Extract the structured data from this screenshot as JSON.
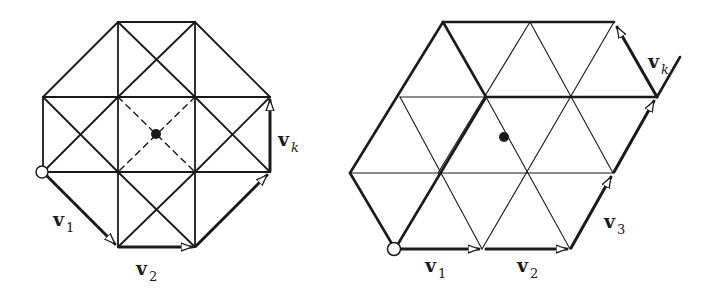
{
  "figures": [
    {
      "id": "square-lattice",
      "labels": {
        "v1": {
          "base": "v",
          "sub": "1"
        },
        "v2": {
          "base": "v",
          "sub": "2"
        },
        "vk": {
          "base": "v",
          "sub": "k"
        }
      }
    },
    {
      "id": "triangular-lattice",
      "labels": {
        "v1": {
          "base": "v",
          "sub": "1"
        },
        "v2": {
          "base": "v",
          "sub": "2"
        },
        "v3": {
          "base": "v",
          "sub": "3"
        },
        "vk": {
          "base": "v",
          "sub": "k"
        }
      }
    }
  ],
  "colors": {
    "stroke": "#1a1a1a",
    "background": "#ffffff"
  }
}
